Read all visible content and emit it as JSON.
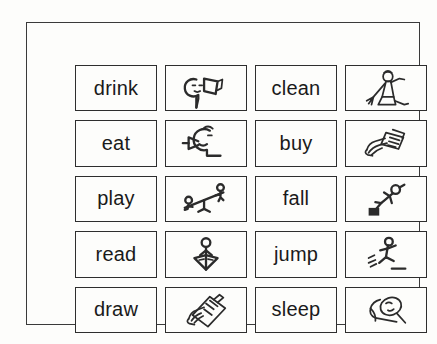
{
  "sheet": {
    "title": "verb picture-word matching sheet",
    "background_color": "#fdfdfb",
    "ink_color": "#2b2b2b",
    "border_color": "#3a3a3a"
  },
  "grid": {
    "columns": 4,
    "rows": 5,
    "column_kinds": [
      "word",
      "picture",
      "word",
      "picture"
    ]
  },
  "rows": [
    {
      "left_word": "drink",
      "left_picture": "head-drinking-from-cup-icon",
      "right_word": "clean",
      "right_picture": "person-sweeping-with-broom-icon"
    },
    {
      "left_word": "eat",
      "left_picture": "head-eating-with-spoon-icon",
      "right_word": "buy",
      "right_picture": "hand-holding-money-icon"
    },
    {
      "left_word": "play",
      "left_picture": "two-figures-on-seesaw-icon",
      "right_word": "fall",
      "right_picture": "figure-tripping-over-block-icon"
    },
    {
      "left_word": "read",
      "left_picture": "figure-reading-open-book-icon",
      "right_word": "jump",
      "right_picture": "figure-jumping-over-line-icon"
    },
    {
      "left_word": "draw",
      "left_picture": "hand-drawing-on-paper-icon",
      "right_word": "sleep",
      "right_picture": "head-on-pillow-icon"
    }
  ]
}
